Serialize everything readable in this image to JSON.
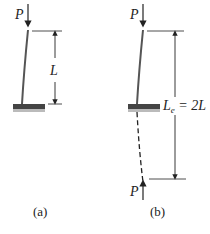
{
  "figure_a": {
    "load_label": "P",
    "length_label": "L",
    "caption": "(a)"
  },
  "figure_b": {
    "top_load_label": "P",
    "bottom_load_label": "P",
    "effective_length_label": "L",
    "effective_length_subscript": "e",
    "effective_length_value": " = 2L",
    "caption": "(b)"
  },
  "colors": {
    "column": "#555555",
    "base": "#444444",
    "lines": "#222222"
  }
}
